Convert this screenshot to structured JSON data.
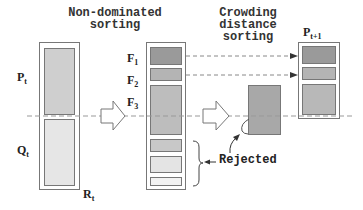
{
  "titles": {
    "nondominated": [
      "Non-dominated",
      "sorting"
    ],
    "crowding": [
      "Crowding",
      "distance",
      "sorting"
    ]
  },
  "labels": {
    "pt": {
      "main": "P",
      "sub": "t"
    },
    "qt": {
      "main": "Q",
      "sub": "t"
    },
    "rt": {
      "main": "R",
      "sub": "t"
    },
    "f1": {
      "main": "F",
      "sub": "1"
    },
    "f2": {
      "main": "F",
      "sub": "2"
    },
    "f3": {
      "main": "F",
      "sub": "3"
    },
    "pt1": {
      "main": "P",
      "sub": "t+1"
    },
    "rejected": "Rejected"
  },
  "colors": {
    "f1": "#9a9a9a",
    "f2": "#b4b4b4",
    "f3": "#bdbdbd",
    "pt": "#cfcfcf",
    "qt": "#e6e6e6",
    "rej1": "#c8c8c8",
    "rej2": "#e4e4e4",
    "rej3": "#f2f2f2",
    "crowd": "#a8a8a8",
    "line": "#999999"
  }
}
